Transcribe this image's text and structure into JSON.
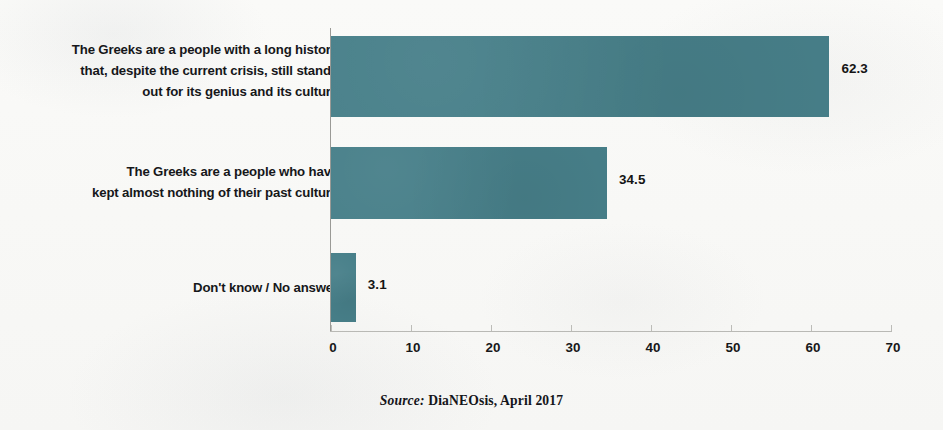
{
  "chart_data": {
    "type": "bar",
    "orientation": "horizontal",
    "title": "",
    "subtitle": "",
    "xlabel": "",
    "ylabel": "",
    "categories": [
      "The Greeks are a people with a long history\nthat, despite the current crisis, still stands\nout for its genius and its culture",
      "The Greeks are a people who have\nkept almost nothing of their past culture",
      "Don't know / No answer"
    ],
    "values": [
      62.3,
      34.5,
      3.1
    ],
    "value_labels": [
      "62.3",
      "34.5",
      "3.1"
    ],
    "xlim": [
      0,
      70
    ],
    "xticks": [
      0,
      10,
      20,
      30,
      40,
      50,
      60,
      70
    ],
    "xtick_labels": [
      "0",
      "10",
      "20",
      "30",
      "40",
      "50",
      "60",
      "70"
    ],
    "grid": false,
    "legend": null,
    "bar_color": "#477f89",
    "annotations": []
  },
  "source": {
    "key": "Source:",
    "text": " DiaNEOsis, April 2017"
  },
  "colors": {
    "bar": "#477f89",
    "background": "#f9f9f7",
    "text": "#16171a",
    "axis": "#b9b9b5"
  }
}
